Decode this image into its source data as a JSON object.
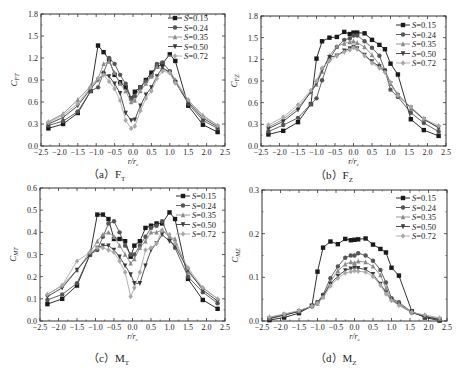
{
  "figure": {
    "captions": [
      "（a）F",
      "（b）F",
      "（c）M",
      "（d）M"
    ],
    "caption_subs": [
      "T",
      "Z",
      "T",
      "Z"
    ]
  },
  "legend_labels": [
    "S=0.15",
    "S=0.24",
    "S=0.35",
    "S=0.50",
    "S=0.72"
  ],
  "series_styles": [
    {
      "name": "S=0.15",
      "color": "#1a1a1a",
      "marker": "square"
    },
    {
      "name": "S=0.24",
      "color": "#555555",
      "marker": "circle"
    },
    {
      "name": "S=0.35",
      "color": "#8a8a8a",
      "marker": "triangle-up"
    },
    {
      "name": "S=0.50",
      "color": "#3a3a3a",
      "marker": "triangle-down"
    },
    {
      "name": "S=0.72",
      "color": "#a8a8a8",
      "marker": "diamond"
    }
  ],
  "chart_data": [
    {
      "type": "line",
      "id": "a",
      "title": "(a) F_T",
      "xlabel": "r/r_c",
      "ylabel": "C_FT",
      "xlim": [
        -2.5,
        2.5
      ],
      "ylim": [
        0,
        1.8
      ],
      "xticks": [
        "-2.5",
        "-2.0",
        "-1.5",
        "-1.0",
        "-0.5",
        "0.0",
        "0.5",
        "1.0",
        "1.5",
        "2.0",
        "2.5"
      ],
      "yticks": [
        "0.0",
        "0.3",
        "0.6",
        "0.9",
        "1.2",
        "1.5",
        "1.8"
      ],
      "legend_position": "upper right",
      "x": [
        -2.3,
        -1.9,
        -1.5,
        -1.15,
        -0.95,
        -0.8,
        -0.65,
        -0.5,
        -0.35,
        -0.2,
        -0.05,
        0.05,
        0.2,
        0.35,
        0.5,
        0.65,
        0.8,
        1.0,
        1.15,
        1.5,
        1.9,
        2.3
      ],
      "series": [
        {
          "name": "S=0.15",
          "values": [
            0.24,
            0.3,
            0.45,
            0.75,
            1.37,
            1.28,
            1.18,
            0.97,
            0.87,
            0.8,
            0.65,
            0.74,
            0.8,
            0.9,
            1.0,
            1.08,
            1.12,
            1.25,
            1.16,
            0.55,
            0.29,
            0.19
          ]
        },
        {
          "name": "S=0.24",
          "values": [
            0.28,
            0.34,
            0.47,
            0.75,
            0.8,
            1.0,
            1.2,
            1.12,
            0.97,
            0.85,
            0.65,
            0.68,
            0.8,
            0.88,
            0.95,
            1.12,
            1.14,
            1.02,
            0.88,
            0.58,
            0.35,
            0.24
          ]
        },
        {
          "name": "S=0.35",
          "values": [
            0.33,
            0.44,
            0.63,
            0.82,
            0.92,
            1.12,
            1.15,
            1.0,
            0.85,
            0.75,
            0.6,
            0.62,
            0.75,
            0.85,
            0.95,
            1.08,
            1.05,
            1.02,
            0.9,
            0.62,
            0.42,
            0.28
          ]
        },
        {
          "name": "S=0.50",
          "values": [
            0.3,
            0.39,
            0.55,
            0.78,
            0.9,
            0.98,
            0.95,
            0.85,
            0.72,
            0.45,
            0.35,
            0.36,
            0.55,
            0.7,
            0.8,
            0.95,
            1.07,
            1.0,
            0.87,
            0.6,
            0.38,
            0.26
          ]
        },
        {
          "name": "S=0.72",
          "values": [
            0.32,
            0.42,
            0.58,
            0.8,
            0.92,
            0.97,
            0.88,
            0.78,
            0.62,
            0.35,
            0.24,
            0.27,
            0.48,
            0.65,
            0.75,
            0.92,
            1.02,
            1.0,
            0.86,
            0.63,
            0.4,
            0.28
          ]
        }
      ]
    },
    {
      "type": "line",
      "id": "b",
      "title": "(b) F_Z",
      "xlabel": "r/r_c",
      "ylabel": "C_FZ",
      "xlim": [
        -2.5,
        2.5
      ],
      "ylim": [
        0,
        1.8
      ],
      "xticks": [
        "-2.5",
        "-2.0",
        "-1.5",
        "-1.0",
        "-0.5",
        "0.0",
        "0.5",
        "1.0",
        "1.5",
        "2.0",
        "2.5"
      ],
      "yticks": [
        "0.0",
        "0.3",
        "0.6",
        "0.9",
        "1.2",
        "1.5",
        "1.8"
      ],
      "legend_position": "upper right",
      "x": [
        -2.3,
        -1.9,
        -1.5,
        -1.15,
        -1.0,
        -0.85,
        -0.65,
        -0.45,
        -0.25,
        -0.1,
        0.0,
        0.1,
        0.3,
        0.5,
        0.7,
        0.85,
        1.0,
        1.2,
        1.55,
        1.9,
        2.3
      ],
      "series": [
        {
          "name": "S=0.15",
          "values": [
            0.16,
            0.21,
            0.33,
            0.58,
            1.21,
            1.45,
            1.5,
            1.51,
            1.58,
            1.55,
            1.57,
            1.57,
            1.56,
            1.47,
            1.4,
            1.34,
            1.14,
            0.99,
            0.37,
            0.22,
            0.14
          ]
        },
        {
          "name": "S=0.24",
          "values": [
            0.2,
            0.29,
            0.39,
            0.58,
            0.66,
            0.91,
            1.2,
            1.37,
            1.47,
            1.49,
            1.53,
            1.53,
            1.45,
            1.36,
            1.25,
            1.05,
            0.78,
            0.68,
            0.46,
            0.32,
            0.2
          ]
        },
        {
          "name": "S=0.35",
          "values": [
            0.26,
            0.37,
            0.53,
            0.75,
            0.85,
            1.03,
            1.25,
            1.38,
            1.42,
            1.44,
            1.45,
            1.43,
            1.37,
            1.26,
            1.13,
            1.05,
            0.86,
            0.72,
            0.52,
            0.37,
            0.26
          ]
        },
        {
          "name": "S=0.50",
          "values": [
            0.24,
            0.34,
            0.5,
            0.75,
            0.87,
            1.05,
            1.23,
            1.25,
            1.32,
            1.35,
            1.37,
            1.35,
            1.26,
            1.17,
            1.1,
            1.04,
            0.87,
            0.7,
            0.53,
            0.37,
            0.25
          ]
        },
        {
          "name": "S=0.72",
          "values": [
            0.29,
            0.4,
            0.57,
            0.77,
            0.9,
            1.08,
            1.18,
            1.25,
            1.3,
            1.33,
            1.36,
            1.34,
            1.25,
            1.15,
            1.08,
            1.02,
            0.88,
            0.7,
            0.54,
            0.38,
            0.28
          ]
        }
      ]
    },
    {
      "type": "line",
      "id": "c",
      "title": "(c) M_T",
      "xlabel": "r/r_c",
      "ylabel": "C_MT",
      "xlim": [
        -2.5,
        2.5
      ],
      "ylim": [
        0,
        0.6
      ],
      "xticks": [
        "-2.5",
        "-2.0",
        "-1.5",
        "-1.0",
        "-0.5",
        "0.0",
        "0.5",
        "1.0",
        "1.5",
        "2.0",
        "2.5"
      ],
      "yticks": [
        "0.0",
        "0.1",
        "0.2",
        "0.3",
        "0.4",
        "0.5",
        "0.6"
      ],
      "legend_position": "upper right",
      "x": [
        -2.3,
        -1.9,
        -1.5,
        -1.15,
        -0.95,
        -0.8,
        -0.65,
        -0.5,
        -0.35,
        -0.2,
        -0.05,
        0.05,
        0.2,
        0.35,
        0.5,
        0.65,
        0.8,
        1.0,
        1.15,
        1.5,
        1.9,
        2.3
      ],
      "series": [
        {
          "name": "S=0.15",
          "values": [
            0.076,
            0.1,
            0.16,
            0.3,
            0.48,
            0.48,
            0.46,
            0.37,
            0.37,
            0.36,
            0.29,
            0.34,
            0.36,
            0.42,
            0.43,
            0.44,
            0.44,
            0.49,
            0.46,
            0.19,
            0.095,
            0.055
          ]
        },
        {
          "name": "S=0.24",
          "values": [
            0.095,
            0.12,
            0.17,
            0.3,
            0.32,
            0.38,
            0.44,
            0.45,
            0.4,
            0.34,
            0.3,
            0.3,
            0.34,
            0.38,
            0.42,
            0.43,
            0.45,
            0.37,
            0.33,
            0.2,
            0.13,
            0.08
          ]
        },
        {
          "name": "S=0.35",
          "values": [
            0.12,
            0.16,
            0.23,
            0.31,
            0.36,
            0.39,
            0.4,
            0.38,
            0.34,
            0.3,
            0.26,
            0.28,
            0.33,
            0.36,
            0.4,
            0.4,
            0.41,
            0.38,
            0.37,
            0.22,
            0.15,
            0.1
          ]
        },
        {
          "name": "S=0.50",
          "values": [
            0.11,
            0.15,
            0.23,
            0.3,
            0.33,
            0.34,
            0.34,
            0.32,
            0.29,
            0.25,
            0.21,
            0.17,
            0.17,
            0.25,
            0.32,
            0.35,
            0.39,
            0.36,
            0.34,
            0.23,
            0.14,
            0.09
          ]
        },
        {
          "name": "S=0.72",
          "values": [
            0.12,
            0.16,
            0.27,
            0.31,
            0.33,
            0.33,
            0.32,
            0.31,
            0.27,
            0.22,
            0.11,
            0.15,
            0.22,
            0.32,
            0.33,
            0.35,
            0.41,
            0.39,
            0.35,
            0.24,
            0.15,
            0.1
          ]
        }
      ]
    },
    {
      "type": "line",
      "id": "d",
      "title": "(d) M_Z",
      "xlabel": "r/r_c",
      "ylabel": "C_MZ",
      "xlim": [
        -2.5,
        2.5
      ],
      "ylim": [
        0,
        0.3
      ],
      "xticks": [
        "-2.5",
        "-2.0",
        "-1.5",
        "-1.0",
        "-0.5",
        "0.0",
        "0.5",
        "1.0",
        "1.5",
        "2.0",
        "2.5"
      ],
      "yticks": [
        "0.0",
        "0.1",
        "0.2",
        "0.3"
      ],
      "legend_position": "upper right",
      "x": [
        -2.3,
        -1.9,
        -1.5,
        -1.15,
        -1.0,
        -0.85,
        -0.65,
        -0.45,
        -0.25,
        -0.1,
        0.0,
        0.1,
        0.3,
        0.5,
        0.7,
        0.85,
        1.0,
        1.2,
        1.55,
        1.9,
        2.3
      ],
      "series": [
        {
          "name": "S=0.15",
          "values": [
            0.002,
            0.008,
            0.018,
            0.035,
            0.113,
            0.168,
            0.182,
            0.176,
            0.188,
            0.185,
            0.186,
            0.187,
            0.189,
            0.175,
            0.165,
            0.157,
            0.122,
            0.104,
            0.022,
            0.008,
            0.001
          ]
        },
        {
          "name": "S=0.24",
          "values": [
            0.005,
            0.013,
            0.022,
            0.034,
            0.043,
            0.06,
            0.098,
            0.125,
            0.145,
            0.15,
            0.15,
            0.155,
            0.15,
            0.138,
            0.117,
            0.088,
            0.052,
            0.043,
            0.02,
            0.01,
            0.003
          ]
        },
        {
          "name": "S=0.35",
          "values": [
            0.008,
            0.015,
            0.023,
            0.034,
            0.04,
            0.055,
            0.09,
            0.115,
            0.13,
            0.135,
            0.133,
            0.137,
            0.135,
            0.125,
            0.105,
            0.075,
            0.05,
            0.04,
            0.02,
            0.012,
            0.005
          ]
        },
        {
          "name": "S=0.50",
          "values": [
            0.006,
            0.014,
            0.022,
            0.033,
            0.042,
            0.057,
            0.085,
            0.103,
            0.116,
            0.12,
            0.122,
            0.121,
            0.118,
            0.107,
            0.085,
            0.065,
            0.048,
            0.037,
            0.019,
            0.01,
            0.004
          ]
        },
        {
          "name": "S=0.72",
          "values": [
            0.009,
            0.016,
            0.024,
            0.034,
            0.041,
            0.054,
            0.08,
            0.098,
            0.11,
            0.113,
            0.115,
            0.114,
            0.112,
            0.102,
            0.082,
            0.062,
            0.047,
            0.036,
            0.02,
            0.014,
            0.007
          ]
        }
      ]
    }
  ]
}
